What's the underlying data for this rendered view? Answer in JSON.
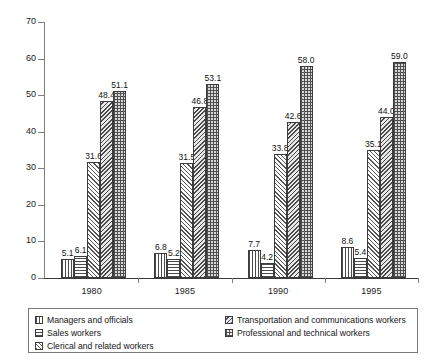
{
  "chart_data": {
    "type": "bar",
    "title": "",
    "xlabel": "",
    "ylabel": "",
    "categories": [
      "1980",
      "1985",
      "1990",
      "1995"
    ],
    "ylim": [
      0,
      70
    ],
    "yticks": [
      0,
      10,
      20,
      30,
      40,
      50,
      60,
      70
    ],
    "grid": false,
    "legend_position": "bottom",
    "series": [
      {
        "name": "Managers and officials",
        "pattern": "vertical-lines",
        "values": [
          5.1,
          6.8,
          7.7,
          8.6
        ]
      },
      {
        "name": "Sales workers",
        "pattern": "horizontal-lines",
        "values": [
          6.1,
          5.2,
          4.2,
          5.4
        ]
      },
      {
        "name": "Clerical and related workers",
        "pattern": "diagonal-hatch",
        "values": [
          31.6,
          31.5,
          33.8,
          35.1
        ]
      },
      {
        "name": "Transportation and communications workers",
        "pattern": "dense-diagonal-hatch",
        "values": [
          48.4,
          46.8,
          42.6,
          44.0
        ]
      },
      {
        "name": "Professional and technical workers",
        "pattern": "cross-hatch-grid",
        "values": [
          51.1,
          53.1,
          58.0,
          59.0
        ]
      }
    ],
    "data_labels": [
      [
        "5.1",
        "6.1",
        "31.6",
        "48.4",
        "51.1"
      ],
      [
        "6.8",
        "5.2",
        "31.5",
        "46.8",
        "53.1"
      ],
      [
        "7.7",
        "4.2",
        "33.8",
        "42.6",
        "58.0"
      ],
      [
        "8.6",
        "5.4",
        "35.1",
        "44.0",
        "59.0"
      ]
    ],
    "ytick_labels": [
      "0",
      "10",
      "20",
      "30",
      "40",
      "50",
      "60",
      "70"
    ]
  },
  "legend": {
    "column1": [
      "Managers and officials",
      "Sales workers",
      "Clerical and related workers"
    ],
    "column2": [
      "Transportation and communications workers",
      "Professional and technical workers"
    ]
  }
}
